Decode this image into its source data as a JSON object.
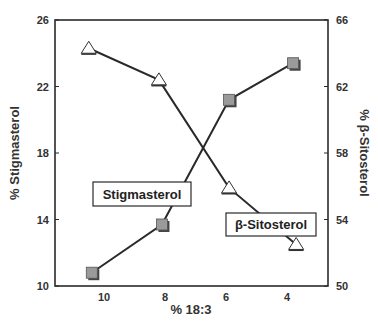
{
  "chart_data": {
    "type": "line",
    "title": "",
    "xlabel": "% 18:3",
    "ylabel": "% Stigmasterol",
    "y2label": "% β-Sitosterol",
    "x_ticks": [
      10,
      8,
      6,
      4
    ],
    "x_range": [
      11.4,
      2.6
    ],
    "x_reversed": true,
    "ylim": [
      10,
      26
    ],
    "y_ticks": [
      10,
      14,
      18,
      22,
      26
    ],
    "y2lim": [
      50,
      66
    ],
    "y2_ticks": [
      50,
      54,
      58,
      62,
      66
    ],
    "grid": false,
    "series": [
      {
        "name": "Stigmasterol",
        "axis": "left",
        "marker": "square",
        "marker_fill": "#9a9a9a",
        "x": [
          10.4,
          8.1,
          5.9,
          3.8
        ],
        "values": [
          10.8,
          13.7,
          21.2,
          23.4
        ]
      },
      {
        "name": "β-Sitosterol",
        "axis": "right",
        "marker": "triangle",
        "marker_fill": "#ffffff",
        "x": [
          10.5,
          8.2,
          5.9,
          3.7
        ],
        "values": [
          64.3,
          62.4,
          55.9,
          52.5
        ]
      }
    ],
    "annotations": [
      {
        "text": "Stigmasterol",
        "series": 0
      },
      {
        "text": "β-Sitosterol",
        "series": 1
      }
    ]
  },
  "labels": {
    "x_title": "% 18:3",
    "y_left_title": "% Stigmasterol",
    "y_right_title": "% β-Sitosterol",
    "callout_stigmasterol": "Stigmasterol",
    "callout_sitosterol": "β-Sitosterol"
  },
  "colors": {
    "line": "#2a2a2a",
    "frame": "#2a2a2a",
    "square_fill": "#9a9a9a",
    "triangle_fill": "#ffffff"
  }
}
